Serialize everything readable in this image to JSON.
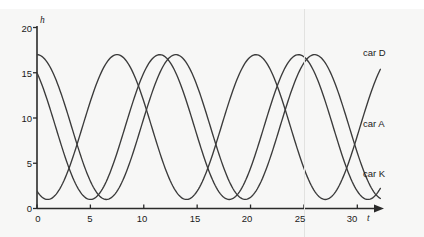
{
  "figure": {
    "background_color": "#f7f7f6",
    "line_color": "#3b3b3b",
    "axis_color": "#2a2a2a"
  },
  "axes": {
    "x": {
      "name": "t",
      "ticks": [
        0,
        5,
        10,
        15,
        20,
        25,
        30
      ],
      "tick_labels": [
        "0",
        "5",
        "10",
        "15",
        "20",
        "25",
        "30"
      ],
      "range": [
        0,
        32.5
      ]
    },
    "y": {
      "name": "h",
      "ticks": [
        0,
        5,
        10,
        15,
        20
      ],
      "tick_labels": [
        "0",
        "5",
        "10",
        "15",
        "20"
      ],
      "range": [
        0,
        20
      ]
    }
  },
  "labels": {
    "car_d": "car D",
    "car_a": "car A",
    "car_k": "car K"
  },
  "chart_data": {
    "type": "line",
    "title": "",
    "xlabel": "t",
    "ylabel": "h",
    "xlim": [
      0,
      32.5
    ],
    "ylim": [
      0,
      20
    ],
    "grid": false,
    "legend_position": "right-inline",
    "midline": 9,
    "amplitude": 8,
    "period": 13,
    "maximum": 17,
    "minimum": 1,
    "series": [
      {
        "name": "car D",
        "start_value": 17,
        "phase_description": "starts at maximum 17 at t=0, falling",
        "peaks_at": [
          0,
          13,
          26
        ],
        "troughs_at": [
          6.5,
          19.5
        ],
        "value_at_t30": 17,
        "x": [
          0,
          1,
          2,
          3,
          4,
          5,
          6,
          7,
          8,
          9,
          10,
          11,
          12,
          13,
          14,
          15,
          16,
          17,
          18,
          19,
          20,
          21,
          22,
          23,
          24,
          25,
          26,
          27,
          28,
          29,
          30
        ],
        "y": [
          17,
          16.6,
          15.5,
          13.8,
          11.7,
          9.5,
          7.2,
          5.2,
          3.5,
          2.2,
          1.4,
          1.0,
          1.2,
          1.9,
          3.1,
          4.7,
          6.6,
          8.6,
          10.7,
          12.6,
          14.4,
          15.8,
          16.6,
          17.0,
          16.8,
          16.0,
          14.8,
          13.2,
          11.2,
          9.1,
          7.0
        ]
      },
      {
        "name": "car A",
        "start_value": 9,
        "phase_description": "starts at midline 9 at t=0, rising",
        "peaks_at": [
          7.5,
          20.5
        ],
        "troughs_at": [
          14,
          27
        ],
        "value_at_t30": 8.5,
        "x": [
          0,
          1,
          2,
          3,
          4,
          5,
          6,
          7,
          8,
          9,
          10,
          11,
          12,
          13,
          14,
          15,
          16,
          17,
          18,
          19,
          20,
          21,
          22,
          23,
          24,
          25,
          26,
          27,
          28,
          29,
          30
        ],
        "y": [
          9.0,
          11.0,
          12.9,
          14.5,
          15.8,
          16.6,
          17.0,
          16.9,
          16.3,
          15.2,
          13.7,
          12.0,
          10.1,
          8.1,
          6.2,
          4.4,
          2.9,
          1.8,
          1.2,
          1.0,
          1.3,
          2.2,
          3.5,
          5.1,
          7.0,
          9.0,
          11.0,
          12.9,
          14.5,
          15.8,
          16.6
        ]
      },
      {
        "name": "car K",
        "start_value": 5,
        "phase_description": "starts at 5 at t=0, falling to minimum near t=5",
        "peaks_at": [
          11.5,
          24.5
        ],
        "troughs_at": [
          5,
          18
        ],
        "value_at_t30": 5,
        "x": [
          0,
          1,
          2,
          3,
          4,
          5,
          6,
          7,
          8,
          9,
          10,
          11,
          12,
          13,
          14,
          15,
          16,
          17,
          18,
          19,
          20,
          21,
          22,
          23,
          24,
          25,
          26,
          27,
          28,
          29,
          30
        ],
        "y": [
          5.0,
          3.5,
          2.3,
          1.5,
          1.0,
          1.0,
          1.5,
          2.5,
          3.9,
          5.6,
          7.5,
          9.5,
          11.4,
          13.2,
          14.7,
          15.9,
          16.7,
          17.0,
          16.8,
          16.2,
          15.1,
          13.6,
          11.9,
          10.0,
          8.0,
          6.1,
          4.4,
          3.0,
          2.0,
          1.3,
          1.0
        ]
      }
    ]
  }
}
